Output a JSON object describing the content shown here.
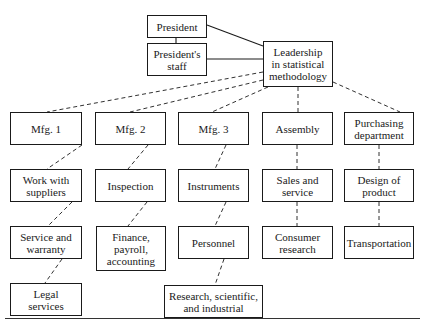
{
  "diagram": {
    "type": "organization-chart",
    "nodes": [
      {
        "id": "president",
        "label": "President"
      },
      {
        "id": "staff",
        "label": "President's\nstaff"
      },
      {
        "id": "leadership",
        "label": "Leadership\nin statistical\nmethodology"
      },
      {
        "id": "mfg1",
        "label": "Mfg. 1"
      },
      {
        "id": "mfg2",
        "label": "Mfg. 2"
      },
      {
        "id": "mfg3",
        "label": "Mfg. 3"
      },
      {
        "id": "assembly",
        "label": "Assembly"
      },
      {
        "id": "purchasing",
        "label": "Purchasing\ndepartment"
      },
      {
        "id": "suppliers",
        "label": "Work with\nsuppliers"
      },
      {
        "id": "inspection",
        "label": "Inspection"
      },
      {
        "id": "instruments",
        "label": "Instruments"
      },
      {
        "id": "sales",
        "label": "Sales and\nservice"
      },
      {
        "id": "design",
        "label": "Design of\nproduct"
      },
      {
        "id": "warranty",
        "label": "Service and\nwarranty"
      },
      {
        "id": "finance",
        "label": "Finance,\npayroll,\naccounting"
      },
      {
        "id": "personnel",
        "label": "Personnel"
      },
      {
        "id": "consumer",
        "label": "Consumer\nresearch"
      },
      {
        "id": "transportation",
        "label": "Transportation"
      },
      {
        "id": "legal",
        "label": "Legal\nservices"
      },
      {
        "id": "research",
        "label": "Research, scientific,\nand industrial"
      }
    ],
    "edges": [
      {
        "from": "president",
        "to": "staff",
        "style": "solid"
      },
      {
        "from": "president",
        "to": "leadership",
        "style": "solid"
      },
      {
        "from": "staff",
        "to": "leadership",
        "style": "solid"
      },
      {
        "from": "leadership",
        "to": "mfg1",
        "style": "dashed"
      },
      {
        "from": "leadership",
        "to": "mfg2",
        "style": "dashed"
      },
      {
        "from": "leadership",
        "to": "mfg3",
        "style": "dashed"
      },
      {
        "from": "leadership",
        "to": "assembly",
        "style": "dashed"
      },
      {
        "from": "leadership",
        "to": "purchasing",
        "style": "dashed"
      },
      {
        "from": "mfg1",
        "to": "suppliers",
        "style": "dashed"
      },
      {
        "from": "mfg2",
        "to": "inspection",
        "style": "dashed"
      },
      {
        "from": "mfg3",
        "to": "instruments",
        "style": "dashed"
      },
      {
        "from": "assembly",
        "to": "sales",
        "style": "dashed"
      },
      {
        "from": "purchasing",
        "to": "design",
        "style": "dashed"
      },
      {
        "from": "suppliers",
        "to": "warranty",
        "style": "dashed"
      },
      {
        "from": "inspection",
        "to": "finance",
        "style": "dashed"
      },
      {
        "from": "instruments",
        "to": "personnel",
        "style": "dashed"
      },
      {
        "from": "sales",
        "to": "consumer",
        "style": "dashed"
      },
      {
        "from": "design",
        "to": "transportation",
        "style": "dashed"
      },
      {
        "from": "warranty",
        "to": "legal",
        "style": "dashed"
      },
      {
        "from": "personnel",
        "to": "research",
        "style": "dashed"
      }
    ]
  }
}
